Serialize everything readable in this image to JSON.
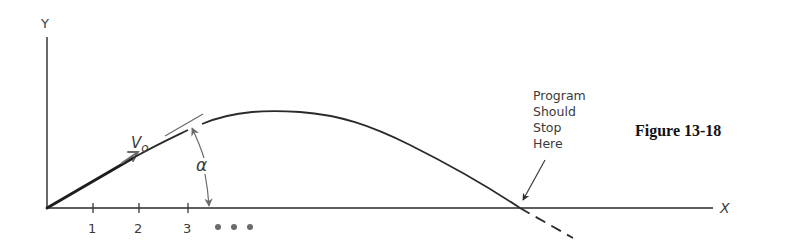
{
  "axes": {
    "y_label": "Y",
    "x_label": "X",
    "x_ticks": [
      "1",
      "2",
      "3"
    ],
    "continuation": "• • •"
  },
  "annotations": {
    "velocity": "V",
    "velocity_sub": "o",
    "angle": "α",
    "stop_note": [
      "Program",
      "Should",
      "Stop",
      "Here"
    ]
  },
  "caption": "Figure 13-18",
  "colors": {
    "ink": "#2a2a2a",
    "gray": "#6a6a6a"
  }
}
